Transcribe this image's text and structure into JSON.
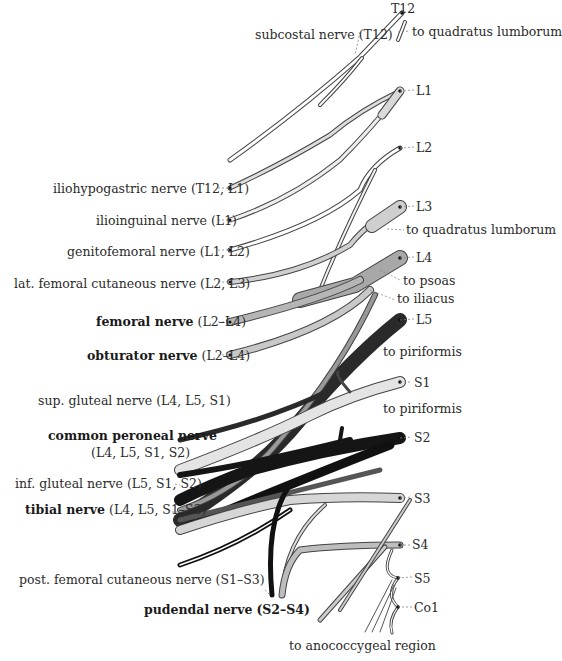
{
  "diagram": {
    "roots": [
      {
        "id": "T12",
        "label": "T12"
      },
      {
        "id": "L1",
        "label": "L1"
      },
      {
        "id": "L2",
        "label": "L2"
      },
      {
        "id": "L3",
        "label": "L3"
      },
      {
        "id": "L4",
        "label": "L4"
      },
      {
        "id": "L5",
        "label": "L5"
      },
      {
        "id": "S1",
        "label": "S1"
      },
      {
        "id": "S2",
        "label": "S2"
      },
      {
        "id": "S3",
        "label": "S3"
      },
      {
        "id": "S4",
        "label": "S4"
      },
      {
        "id": "S5",
        "label": "S5"
      },
      {
        "id": "Co1",
        "label": "Co1"
      }
    ],
    "muscular_branches": [
      {
        "label": "to quadratus lumborum",
        "root": "T12"
      },
      {
        "label": "to quadratus lumborum",
        "root": "L3"
      },
      {
        "label": "to psoas",
        "root": "L4"
      },
      {
        "label": "to iliacus",
        "root": "L4"
      },
      {
        "label": "to piriformis",
        "root": "S1"
      },
      {
        "label": "to piriformis",
        "root": "S2"
      },
      {
        "label": "to anococcygeal region",
        "root": "Co1"
      }
    ],
    "nerves": [
      {
        "name": "subcostal nerve",
        "segments": "(T12)",
        "bold": false
      },
      {
        "name": "iliohypogastric nerve",
        "segments": "(T12, L1)",
        "bold": false
      },
      {
        "name": "ilioinguinal nerve",
        "segments": "(L1)",
        "bold": false
      },
      {
        "name": "genitofemoral nerve",
        "segments": "(L1, L2)",
        "bold": false
      },
      {
        "name": "lat. femoral cutaneous nerve",
        "segments": "(L2, L3)",
        "bold": false
      },
      {
        "name": "femoral nerve",
        "segments": "(L2–L4)",
        "bold": true
      },
      {
        "name": "obturator nerve",
        "segments": "(L2–L4)",
        "bold": true
      },
      {
        "name": "sup. gluteal nerve",
        "segments": "(L4, L5, S1)",
        "bold": false
      },
      {
        "name": "common peroneal nerve",
        "segments": "(L4, L5, S1, S2)",
        "bold": true
      },
      {
        "name": "inf. gluteal nerve",
        "segments": "(L5, S1, S2)",
        "bold": false
      },
      {
        "name": "tibial nerve",
        "segments": "(L4, L5, S1–S3)",
        "bold": true
      },
      {
        "name": "post. femoral cutaneous nerve",
        "segments": "(S1–S3)",
        "bold": false
      },
      {
        "name": "pudendal nerve",
        "segments": "(S2–S4)",
        "bold": true
      }
    ],
    "colors": {
      "T12": "#ffffff",
      "L1": "#d9d9d9",
      "L2": "#ffffff",
      "L3": "#cfcfcf",
      "L4": "#a8a8a8",
      "L5": "#2a2a2a",
      "S1": "#e4e4e4",
      "S2": "#151515",
      "S3": "#d6d6d6",
      "S4": "#bdbdbd",
      "outline": "#3a3a3a"
    }
  }
}
